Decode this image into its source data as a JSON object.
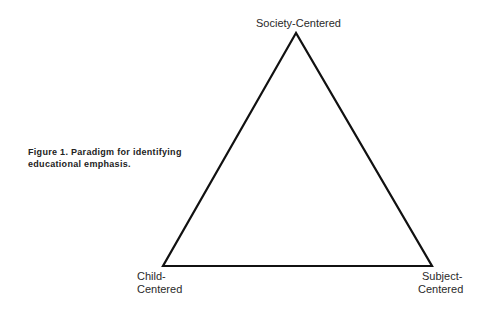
{
  "caption": {
    "line1": "Figure 1. Paradigm for identifying",
    "line2": "educational emphasis."
  },
  "vertices": {
    "top": "Society-Centered",
    "bottom_left_line1": "Child-",
    "bottom_left_line2": "Centered",
    "bottom_right_line1": "Subject-",
    "bottom_right_line2": "Centered"
  },
  "colors": {
    "stroke": "#111111",
    "text": "#2a2a2a"
  }
}
